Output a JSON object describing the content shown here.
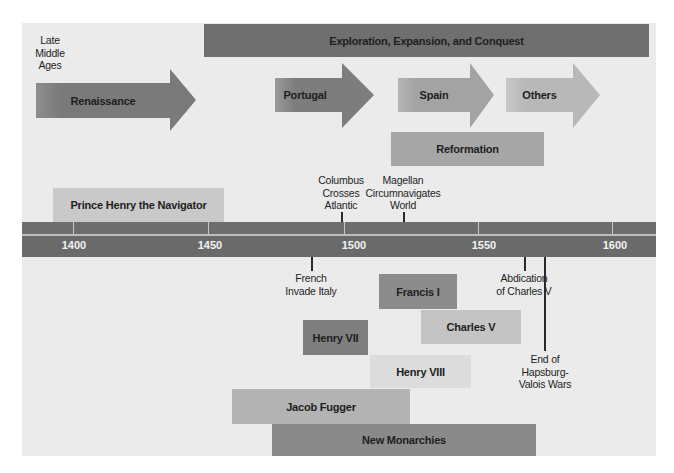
{
  "title_labels": {
    "late_middle_ages": [
      "Late",
      "Middle",
      "Ages"
    ]
  },
  "top_bar": {
    "label": "Exploration, Expansion, and Conquest",
    "color": "#6f6f6f"
  },
  "arrows": [
    {
      "label": "Renaissance",
      "color": "#7a7a7a"
    },
    {
      "label": "Portugal",
      "color": "#7d7d7d"
    },
    {
      "label": "Spain",
      "color": "#a3a3a3"
    },
    {
      "label": "Others",
      "color": "#b8b8b8"
    }
  ],
  "periods_above": [
    {
      "label": "Reformation",
      "color": "#a6a6a6"
    },
    {
      "label": "Prince Henry the Navigator",
      "color": "#c9c9c9"
    }
  ],
  "events_above": [
    {
      "lines": [
        "Columbus",
        "Crosses",
        "Atlantic"
      ]
    },
    {
      "lines": [
        "Magellan",
        "Circumnavigates",
        "World"
      ]
    }
  ],
  "timeline": {
    "years": [
      "1400",
      "1450",
      "1500",
      "1550",
      "1600"
    ]
  },
  "events_below": [
    {
      "lines": [
        "French",
        "Invade Italy"
      ]
    },
    {
      "lines": [
        "Abdication",
        "of Charles V"
      ]
    },
    {
      "lines": [
        "End of",
        "Hapsburg-",
        "Valois Wars"
      ]
    }
  ],
  "periods_below": [
    {
      "label": "Francis I",
      "color": "#8c8c8c"
    },
    {
      "label": "Charles V",
      "color": "#c4c4c4"
    },
    {
      "label": "Henry VII",
      "color": "#7f7f7f"
    },
    {
      "label": "Henry VIII",
      "color": "#dcdcdc"
    },
    {
      "label": "Jacob Fugger",
      "color": "#b3b3b3"
    },
    {
      "label": "New Monarchies",
      "color": "#8a8a8a"
    }
  ]
}
